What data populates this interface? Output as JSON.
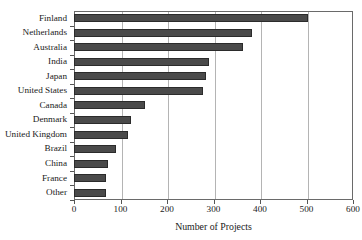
{
  "chart_data": {
    "type": "bar",
    "orientation": "horizontal",
    "title": "",
    "xlabel": "Number of Projects",
    "ylabel": "",
    "xlim": [
      0,
      600
    ],
    "xticks": [
      0,
      100,
      200,
      300,
      400,
      500,
      600
    ],
    "grid": "vertical",
    "legend": "none",
    "bar_color": "#4a4a4a",
    "bar_edge_color": "#2b2b2b",
    "categories": [
      "Finland",
      "Netherlands",
      "Australia",
      "India",
      "Japan",
      "United States",
      "Canada",
      "Denmark",
      "United Kingdom",
      "Brazil",
      "China",
      "France",
      "Other"
    ],
    "values": [
      503,
      383,
      363,
      290,
      284,
      277,
      153,
      123,
      116,
      90,
      73,
      69,
      69
    ]
  }
}
